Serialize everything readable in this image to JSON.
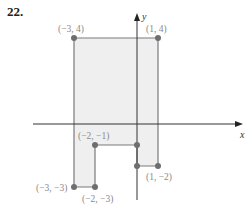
{
  "problem": {
    "number": "22."
  },
  "axes": {
    "x_label": "x",
    "y_label": "y"
  },
  "colors": {
    "fill": "#efefef",
    "edge": "#7a7a7a",
    "point": "#6e6e6e",
    "axis": "#333333",
    "label": "#8a8a8a"
  },
  "polygon": {
    "vertices": [
      {
        "x": -3,
        "y": 4
      },
      {
        "x": 1,
        "y": 4
      },
      {
        "x": 1,
        "y": -2
      },
      {
        "x": 0,
        "y": -2
      },
      {
        "x": 0,
        "y": -1
      },
      {
        "x": -2,
        "y": -1
      },
      {
        "x": -2,
        "y": -3
      },
      {
        "x": -3,
        "y": -3
      }
    ]
  },
  "points": [
    {
      "label": "(−3, 4)"
    },
    {
      "label": "(1, 4)"
    },
    {
      "label": "(−2, −1)"
    },
    {
      "label": "(−3, −3)"
    },
    {
      "label": "(−2, −3)"
    },
    {
      "label": "(1, −2)"
    }
  ]
}
